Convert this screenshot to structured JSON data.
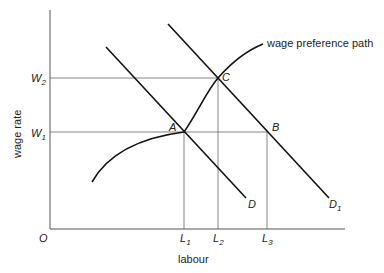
{
  "diagram": {
    "axes": {
      "x_label": "labour",
      "y_label": "wage rate",
      "origin_label": "O"
    },
    "y_ticks": [
      {
        "base": "W",
        "sub": "2"
      },
      {
        "base": "W",
        "sub": "1"
      }
    ],
    "x_ticks": [
      {
        "base": "L",
        "sub": "1"
      },
      {
        "base": "L",
        "sub": "2"
      },
      {
        "base": "L",
        "sub": "3"
      }
    ],
    "points": {
      "A": "A",
      "B": "B",
      "C": "C"
    },
    "curves": {
      "demand": {
        "base": "D",
        "sub": ""
      },
      "demand_shifted": {
        "base": "D",
        "sub": "1"
      },
      "wage_preference": "wage preference path"
    }
  }
}
